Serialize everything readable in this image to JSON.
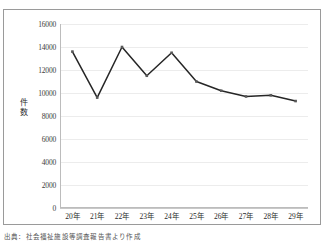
{
  "figure": {
    "caption": "出典：社会福祉施設等調査報告書より作成",
    "top_ghost_text": ""
  },
  "chart_data": {
    "type": "line",
    "title": "",
    "xlabel": "",
    "ylabel": "件数",
    "categories": [
      "20年",
      "21年",
      "22年",
      "23年",
      "24年",
      "25年",
      "26年",
      "27年",
      "28年",
      "29年"
    ],
    "values": [
      13600,
      9600,
      14000,
      11500,
      13500,
      11000,
      10200,
      9700,
      9800,
      9300
    ],
    "ylim": [
      0,
      16000
    ],
    "ytick_values": [
      0,
      2000,
      4000,
      6000,
      8000,
      10000,
      12000,
      14000,
      16000
    ],
    "ytick_labels": [
      "0",
      "2000",
      "4000",
      "6000",
      "8000",
      "10000",
      "12000",
      "14000",
      "16000"
    ],
    "grid": "horizontal",
    "legend": "none",
    "series": [
      {
        "name": "件数",
        "values": [
          13600,
          9600,
          14000,
          11500,
          13500,
          11000,
          10200,
          9700,
          9800,
          9300
        ]
      }
    ],
    "line_color": "#262626",
    "marker_color": "#595959",
    "marker_shape": "diamond"
  }
}
